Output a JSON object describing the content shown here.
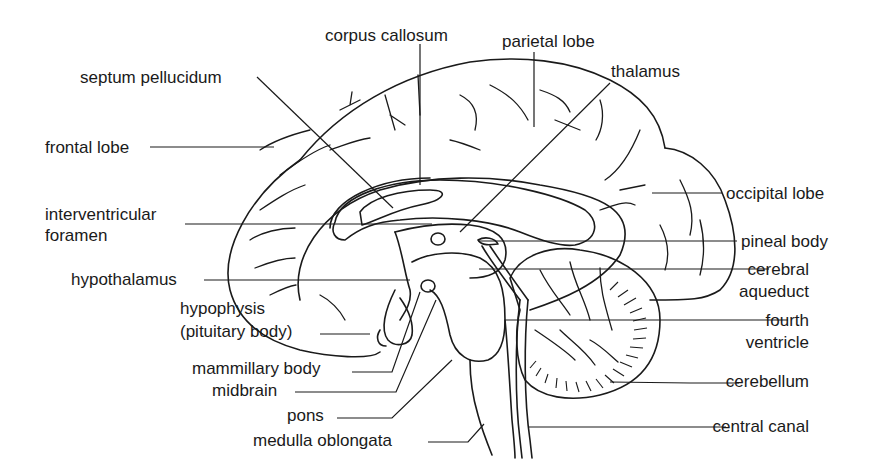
{
  "diagram": {
    "labels": {
      "corpus_callosum": "corpus callosum",
      "parietal_lobe": "parietal lobe",
      "septum_pellucidum": "septum pellucidum",
      "thalamus": "thalamus",
      "frontal_lobe": "frontal lobe",
      "occipital_lobe": "occipital lobe",
      "interventricular_foramen_1": "interventricular",
      "interventricular_foramen_2": "foramen",
      "pineal_body": "pineal body",
      "hypothalamus": "hypothalamus",
      "cerebral_aqueduct_1": "cerebral",
      "cerebral_aqueduct_2": "aqueduct",
      "hypophysis_1": "hypophysis",
      "hypophysis_2": "(pituitary body)",
      "fourth_ventricle_1": "fourth",
      "fourth_ventricle_2": "ventricle",
      "mammillary_body": "mammillary body",
      "midbrain": "midbrain",
      "cerebellum": "cerebellum",
      "pons": "pons",
      "central_canal": "central canal",
      "medulla_oblongata": "medulla oblongata"
    }
  }
}
